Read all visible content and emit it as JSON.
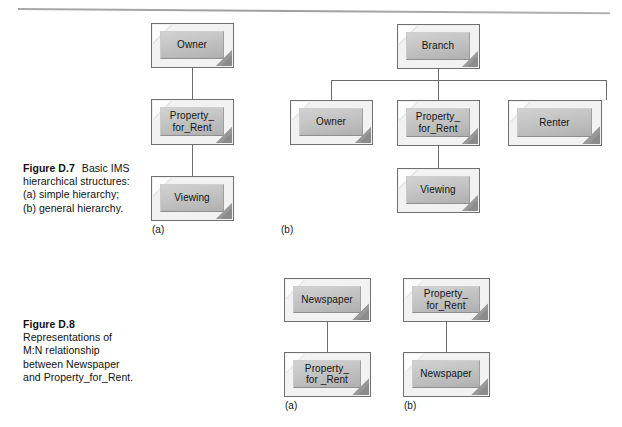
{
  "page": {
    "background": "#ffffff",
    "rule_color": "#8e8e8e",
    "box_face_color": "#c6c6c6",
    "line_color": "#6b6b6b"
  },
  "figures": [
    {
      "id": "figure-d7",
      "caption": {
        "number": "Figure D.7",
        "line1": "Basic IMS",
        "line2": "hierarchical structures:",
        "line3": "(a) simple hierarchy;",
        "line4": "(b) general hierarchy."
      },
      "diagrams": [
        {
          "id": "d7-a",
          "sublabel": "(a)",
          "nodes": [
            {
              "id": "d7a-owner",
              "label": "Owner"
            },
            {
              "id": "d7a-property",
              "label": "Property_\nfor_Rent"
            },
            {
              "id": "d7a-viewing",
              "label": "Viewing"
            }
          ]
        },
        {
          "id": "d7-b",
          "sublabel": "(b)",
          "nodes": [
            {
              "id": "d7b-branch",
              "label": "Branch"
            },
            {
              "id": "d7b-owner",
              "label": "Owner"
            },
            {
              "id": "d7b-property",
              "label": "Property_\nfor_Rent"
            },
            {
              "id": "d7b-renter",
              "label": "Renter"
            },
            {
              "id": "d7b-viewing",
              "label": "Viewing"
            }
          ]
        }
      ]
    },
    {
      "id": "figure-d8",
      "caption": {
        "number": "Figure D.8",
        "line1": "Representations of",
        "line2": "M:N relationship",
        "line3": "between Newspaper",
        "line4": "and Property_for_Rent."
      },
      "diagrams": [
        {
          "id": "d8-a",
          "sublabel": "(a)",
          "nodes": [
            {
              "id": "d8a-newspaper",
              "label": "Newspaper"
            },
            {
              "id": "d8a-property",
              "label": "Property_\nfor _Rent"
            }
          ]
        },
        {
          "id": "d8-b",
          "sublabel": "(b)",
          "nodes": [
            {
              "id": "d8b-property",
              "label": "Property_\nfor_Rent"
            },
            {
              "id": "d8b-newspaper",
              "label": "Newspaper"
            }
          ]
        }
      ]
    }
  ]
}
